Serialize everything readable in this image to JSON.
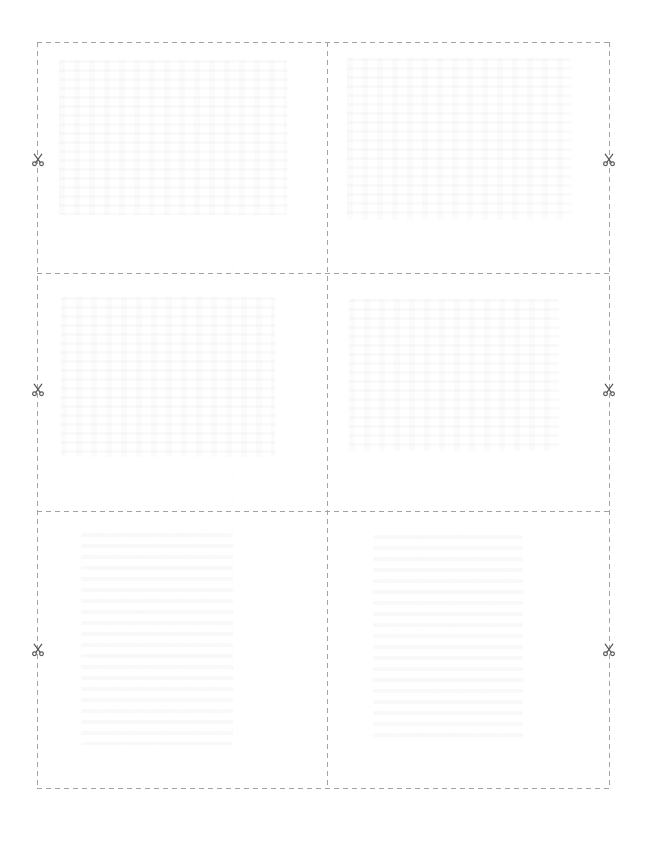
{
  "document": {
    "kind": "printable-cut-sheet",
    "page_width": 647,
    "page_height": 841,
    "background_color": "#ffffff",
    "orientation": "portrait"
  },
  "cut_guides": {
    "line_color": "#a3a3a3",
    "line_style": "dashed",
    "dash_length_px": 5,
    "gap_length_px": 4,
    "grid": {
      "left": 37,
      "top": 42,
      "right": 610,
      "bottom": 789,
      "columns": 2,
      "rows": 3,
      "vertical_divider_x": [
        327
      ],
      "horizontal_divider_y": [
        273,
        511
      ]
    }
  },
  "scissors_markers": {
    "icon": "scissors-icon",
    "color": "#5a5a5a",
    "size_px": 14,
    "positions": [
      {
        "side": "left",
        "x": 38,
        "y": 160
      },
      {
        "side": "right",
        "x": 609,
        "y": 160
      },
      {
        "side": "left",
        "x": 38,
        "y": 390
      },
      {
        "side": "right",
        "x": 609,
        "y": 390
      },
      {
        "side": "left",
        "x": 38,
        "y": 650
      },
      {
        "side": "right",
        "x": 609,
        "y": 650
      }
    ]
  },
  "cells": [
    {
      "id": "cell-1",
      "row": 1,
      "column": 1,
      "content_label": "",
      "ghost": {
        "left": 22,
        "top": 18,
        "width": 228,
        "height": 155,
        "variant": "text"
      }
    },
    {
      "id": "cell-2",
      "row": 1,
      "column": 2,
      "content_label": "",
      "ghost": {
        "left": 20,
        "top": 16,
        "width": 224,
        "height": 162,
        "variant": "text"
      }
    },
    {
      "id": "cell-3",
      "row": 2,
      "column": 1,
      "content_label": "",
      "ghost": {
        "left": 24,
        "top": 24,
        "width": 214,
        "height": 160,
        "variant": "text"
      }
    },
    {
      "id": "cell-4",
      "row": 2,
      "column": 2,
      "content_label": "",
      "ghost": {
        "left": 22,
        "top": 26,
        "width": 210,
        "height": 152,
        "variant": "text"
      }
    },
    {
      "id": "cell-5",
      "row": 3,
      "column": 1,
      "content_label": "",
      "ghost": {
        "left": 44,
        "top": 22,
        "width": 152,
        "height": 212,
        "variant": "block"
      }
    },
    {
      "id": "cell-6",
      "row": 3,
      "column": 2,
      "content_label": "",
      "ghost": {
        "left": 46,
        "top": 24,
        "width": 150,
        "height": 208,
        "variant": "block"
      }
    }
  ]
}
